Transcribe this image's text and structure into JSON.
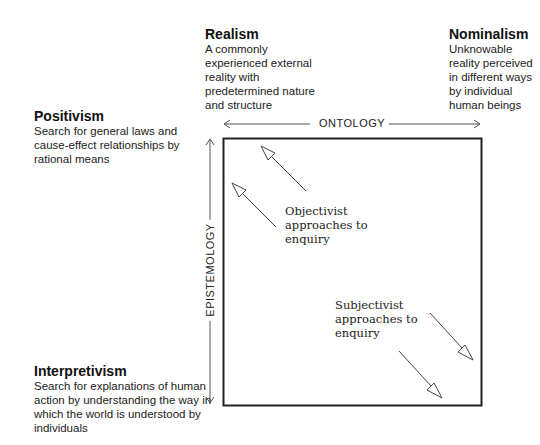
{
  "ontology": {
    "axis_label": "ONTOLOGY",
    "realism": {
      "title": "Realism",
      "lines": [
        "A commonly",
        "experienced external",
        "reality with",
        "predetermined nature",
        "and structure"
      ]
    },
    "nominalism": {
      "title": "Nominalism",
      "lines": [
        "Unknowable",
        "reality perceived",
        "in different ways",
        "by individual",
        "human beings"
      ]
    }
  },
  "epistemology": {
    "axis_label": "EPISTEMOLOGY",
    "positivism": {
      "title": "Positivism",
      "lines": [
        "Search for general laws and",
        "cause-effect relationships by",
        "rational means"
      ]
    },
    "interpretivism": {
      "title": "Interpretivism",
      "lines": [
        "Search for explanations of human",
        "action by understanding the way in",
        "which the world is understood by",
        "individuals"
      ]
    }
  },
  "approaches": {
    "objectivist": {
      "lines": [
        "Objectivist",
        "approaches to",
        "enquiry"
      ],
      "direction": "up-left"
    },
    "subjectivist": {
      "lines": [
        "Subjectivist",
        "approaches to",
        "enquiry"
      ],
      "direction": "down-right"
    }
  },
  "colors": {
    "line": "#555555",
    "box": "#222222",
    "text": "#1a1a1a"
  }
}
